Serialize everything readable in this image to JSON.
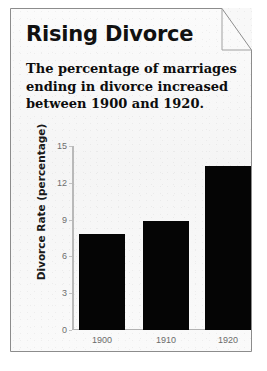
{
  "card": {
    "title": "Rising Divorce",
    "subtitle_lines": [
      "The percentage of marriages",
      "ending in divorce increased",
      "between 1900 and 1920."
    ],
    "page_curl": "page-curl-corner",
    "paper_color": "#f8f8f8",
    "border_color": "#8c8c8c"
  },
  "chart_data": {
    "type": "bar",
    "title": "Rising Divorce",
    "categories": [
      "1900",
      "1910",
      "1920"
    ],
    "values": [
      7.8,
      8.9,
      13.4
    ],
    "xlabel": "",
    "ylabel": "Divorce Rate (percentage)",
    "ylim": [
      0,
      15
    ],
    "yticks": [
      0,
      3,
      6,
      9,
      12,
      15
    ],
    "ytick_labels": [
      "0",
      "3",
      "6",
      "9",
      "12",
      "15"
    ],
    "grid": false,
    "legend": false,
    "bar_color": "#050505",
    "axis_color": "#b9b9b9"
  }
}
